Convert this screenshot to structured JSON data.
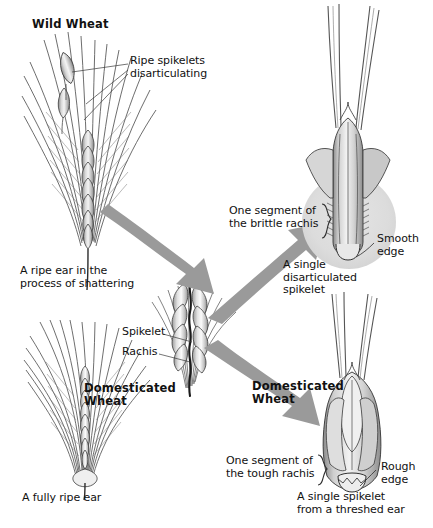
{
  "figure": {
    "type": "botanical-diagram",
    "background_color": "#ffffff",
    "ink_color": "#111111",
    "arrow_color": "#9a9a9a",
    "shade_color": "#c9c9c9"
  },
  "labels": {
    "wild_wheat": "Wild Wheat",
    "ripe_spikelets": "Ripe spikelets\ndisarticulating",
    "ripe_ear_shattering": "A ripe ear in the\nprocess of shattering",
    "domesticated_wheat_left": "Domesticated\nWheat",
    "fully_ripe_ear": "A fully ripe ear",
    "spikelet": "Spikelet",
    "rachis": "Rachis",
    "brittle_rachis_segment": "One segment of\nthe brittle rachis",
    "smooth_edge": "Smooth\nedge",
    "single_disarticulated_spikelet": "A single\ndisarticulated\nspikelet",
    "domesticated_wheat_right": "Domesticated\nWheat",
    "tough_rachis_segment": "One segment of\nthe tough rachis",
    "rough_edge": "Rough\nedge",
    "single_spikelet_threshed": "A single spikelet\nfrom a threshed ear"
  },
  "panels": [
    {
      "name": "wild-wheat-ear",
      "heading": "Wild Wheat",
      "caption": "A ripe ear in the process of shattering",
      "annotations": [
        "Ripe spikelets disarticulating"
      ]
    },
    {
      "name": "domesticated-wheat-ear",
      "heading": "Domesticated Wheat",
      "caption": "A fully ripe ear",
      "annotations": []
    },
    {
      "name": "central-ear-detail",
      "heading": "",
      "caption": "",
      "annotations": [
        "Spikelet",
        "Rachis"
      ]
    },
    {
      "name": "wild-spikelet-detail",
      "heading": "",
      "caption": "A single disarticulated spikelet",
      "annotations": [
        "One segment of the brittle rachis",
        "Smooth edge"
      ]
    },
    {
      "name": "domesticated-spikelet-detail",
      "heading": "Domesticated Wheat",
      "caption": "A single spikelet from a threshed ear",
      "annotations": [
        "One segment of the tough rachis",
        "Rough edge"
      ]
    }
  ]
}
